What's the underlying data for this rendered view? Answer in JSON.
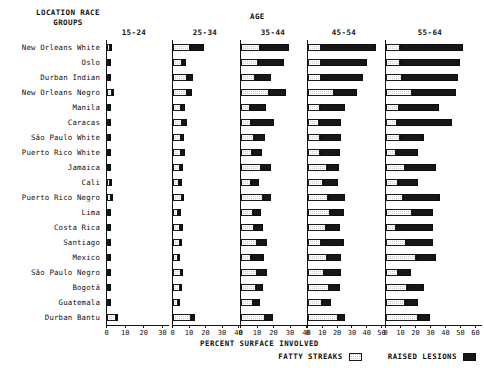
{
  "header": {
    "left_title_line1": "LOCATION RACE",
    "left_title_line2": "GROUPS",
    "age_title": "AGE"
  },
  "footer": {
    "xlabel": "PERCENT SURFACE INVOLVED",
    "legend": [
      {
        "label": "FATTY STREAKS",
        "swatch": "hatched-light-swatch",
        "color": "#c9c9c9"
      },
      {
        "label": "RAISED LESIONS",
        "swatch": "solid-dark-swatch",
        "color": "#171717"
      }
    ]
  },
  "chart_data": {
    "type": "bar",
    "title": "AGE",
    "xlabel": "PERCENT SURFACE INVOLVED",
    "ylabel": "LOCATION RACE GROUPS",
    "orientation": "horizontal",
    "stacked": true,
    "grid": false,
    "legend_position": "bottom-right",
    "categories": [
      "New Orleans White",
      "Oslo",
      "Durban Indian",
      "New Orleans Negro",
      "Manila",
      "Caracas",
      "São Paulo White",
      "Puerto Rico White",
      "Jamaica",
      "Cali",
      "Puerto Rico Negro",
      "Lima",
      "Costa Rica",
      "Santiago",
      "Mexico",
      "São Paulo Negro",
      "Bogotá",
      "Guatemala",
      "Durban Bantu"
    ],
    "series_names": [
      "FATTY STREAKS",
      "RAISED LESIONS"
    ],
    "panels": [
      {
        "name": "15-24",
        "xlim": [
          0,
          30
        ],
        "ticks": [
          0,
          10,
          20,
          30
        ],
        "fatty_streaks": [
          1.6,
          1.2,
          0.8,
          2.6,
          1.2,
          1.3,
          0.8,
          0.9,
          0.8,
          1.4,
          2.0,
          0.9,
          0.9,
          0.8,
          0.8,
          1.3,
          0.7,
          0.5,
          4.6
        ],
        "raised_lesions": [
          1.1,
          0.9,
          0.7,
          0.9,
          0.9,
          0.4,
          0.5,
          0.6,
          0.5,
          0.5,
          0.4,
          0.5,
          0.5,
          0.4,
          0.5,
          0.5,
          0.4,
          0.3,
          0.4
        ]
      },
      {
        "name": "25-34",
        "xlim": [
          0,
          40
        ],
        "ticks": [
          0,
          10,
          20,
          30,
          40
        ],
        "fatty_streaks": [
          10.0,
          5.4,
          8.2,
          8.5,
          4.8,
          5.6,
          4.6,
          4.7,
          4.4,
          3.6,
          5.2,
          3.2,
          4.4,
          4.0,
          3.0,
          4.6,
          4.2,
          3.0,
          11.0
        ],
        "raised_lesions": [
          8.6,
          2.4,
          4.0,
          3.3,
          2.6,
          3.0,
          2.1,
          2.3,
          1.9,
          1.7,
          1.5,
          1.8,
          1.6,
          1.5,
          1.4,
          1.6,
          1.3,
          1.2,
          2.2
        ]
      },
      {
        "name": "35-44",
        "xlim": [
          0,
          40
        ],
        "ticks": [
          0,
          10,
          20,
          30,
          40
        ],
        "fatty_streaks": [
          11.5,
          10.0,
          8.6,
          17.0,
          5.6,
          6.0,
          8.0,
          6.5,
          12.0,
          6.2,
          13.5,
          7.0,
          8.0,
          9.5,
          6.0,
          9.5,
          9.0,
          7.5,
          14.5
        ],
        "raised_lesions": [
          17.5,
          16.0,
          9.5,
          10.0,
          9.5,
          14.0,
          6.5,
          6.0,
          6.0,
          5.0,
          4.5,
          5.0,
          5.5,
          6.5,
          8.0,
          6.5,
          4.5,
          4.0,
          5.0
        ]
      },
      {
        "name": "45-54",
        "xlim": [
          0,
          50
        ],
        "ticks": [
          0,
          10,
          20,
          30,
          40,
          50
        ],
        "fatty_streaks": [
          9.0,
          9.0,
          9.0,
          17.5,
          8.0,
          7.5,
          8.0,
          8.0,
          12.5,
          10.0,
          13.5,
          15.0,
          12.0,
          9.0,
          13.0,
          11.0,
          14.5,
          9.5,
          20.5
        ],
        "raised_lesions": [
          37.0,
          31.0,
          28.5,
          15.5,
          17.0,
          15.0,
          14.5,
          13.5,
          8.5,
          10.0,
          11.5,
          9.5,
          9.5,
          15.5,
          9.5,
          11.0,
          7.0,
          6.0,
          4.5
        ]
      },
      {
        "name": "55-64",
        "xlim": [
          0,
          60
        ],
        "ticks": [
          0,
          10,
          20,
          30,
          40,
          50,
          60
        ],
        "fatty_streaks": [
          9.0,
          9.5,
          10.5,
          17.5,
          8.5,
          7.0,
          9.0,
          6.5,
          12.5,
          8.0,
          11.5,
          17.0,
          6.5,
          13.5,
          20.0,
          8.0,
          14.0,
          12.5,
          21.0
        ],
        "raised_lesions": [
          42.0,
          39.5,
          37.5,
          29.0,
          27.0,
          37.0,
          16.5,
          14.5,
          20.5,
          13.0,
          24.5,
          14.5,
          24.5,
          17.5,
          13.0,
          8.5,
          11.0,
          8.5,
          8.0
        ]
      }
    ]
  }
}
